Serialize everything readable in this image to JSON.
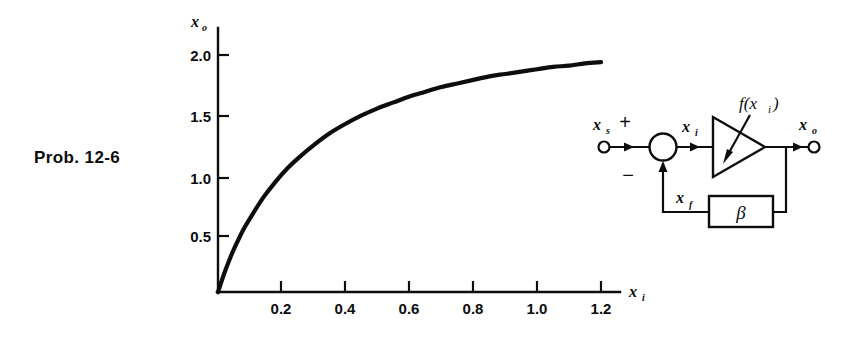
{
  "figure": {
    "caption": "Prob. 12-6"
  },
  "chart_data": {
    "type": "line",
    "title": "",
    "xlabel": "x i",
    "ylabel": "x o",
    "xlabel_base": "x",
    "xlabel_sub": "i",
    "ylabel_base": "x",
    "ylabel_sub": "o",
    "xlim": [
      0,
      1.3
    ],
    "ylim": [
      0,
      2.15
    ],
    "xticks": [
      0.2,
      0.4,
      0.6,
      0.8,
      1.0,
      1.2
    ],
    "xtick_labels": [
      "0.2",
      "0.4",
      "0.6",
      "0.8",
      "1.0",
      "1.2"
    ],
    "yticks": [
      0.5,
      1.0,
      1.5,
      2.0
    ],
    "ytick_labels": [
      "0.5",
      "1.0",
      "1.5",
      "2.0"
    ],
    "grid": false,
    "legend": "none",
    "series": [
      {
        "name": "transfer characteristic",
        "x": [
          0.0,
          0.02,
          0.04,
          0.06,
          0.08,
          0.1,
          0.14,
          0.18,
          0.22,
          0.26,
          0.3,
          0.35,
          0.4,
          0.45,
          0.5,
          0.55,
          0.6,
          0.65,
          0.7,
          0.75,
          0.8,
          0.85,
          0.9,
          0.95,
          1.0,
          1.05,
          1.1,
          1.15,
          1.2
        ],
        "y": [
          0.0,
          0.16,
          0.3,
          0.42,
          0.53,
          0.62,
          0.79,
          0.93,
          1.05,
          1.15,
          1.24,
          1.34,
          1.42,
          1.49,
          1.55,
          1.6,
          1.65,
          1.69,
          1.73,
          1.76,
          1.79,
          1.82,
          1.84,
          1.86,
          1.88,
          1.9,
          1.91,
          1.93,
          1.94
        ]
      }
    ]
  },
  "block_diagram": {
    "name": "feedback-amplifier-block-diagram",
    "input_terminal_label_base": "x",
    "input_terminal_label_sub": "s",
    "plus_sign": "+",
    "minus_sign": "−",
    "summing_node_name": "summing-junction",
    "mixer_output_label_base": "x",
    "mixer_output_label_sub": "i",
    "amplifier_label_base": "f(x",
    "amplifier_label_sub": "i",
    "amplifier_label_tail": ")",
    "amplifier_label_full": "f(x i )",
    "output_terminal_label_base": "x",
    "output_terminal_label_sub": "o",
    "feedback_label_base": "x",
    "feedback_label_sub": "f",
    "feedback_block_label": "β"
  },
  "colors": {
    "ink": "#0d0d0d",
    "paper": "#ffffff"
  }
}
